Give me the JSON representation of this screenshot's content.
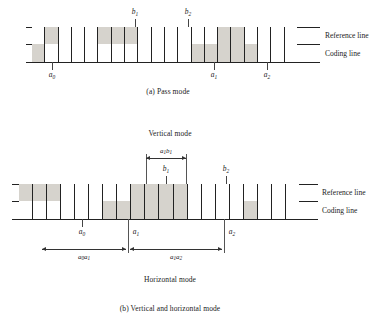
{
  "figure": {
    "title_a": "(a)  Pass mode",
    "title_b": "(b)  Vertical and horizontal mode",
    "shade_color": "#d6d3cd",
    "line_color": "#222222"
  },
  "panel_a": {
    "caption": "(a)  Pass mode",
    "row_labels": {
      "reference": "Reference line",
      "coding": "Coding line"
    },
    "reference_cells": 20,
    "coding_cells": 20,
    "reference_shaded": [
      2,
      6,
      7,
      8,
      15,
      16
    ],
    "coding_shaded": [
      1,
      13,
      14,
      15,
      16,
      17
    ],
    "markers_above": [
      {
        "label": "b",
        "sub": "1",
        "cell": 6
      },
      {
        "label": "b",
        "sub": "2",
        "cell": 10
      }
    ],
    "markers_below": [
      {
        "label": "a",
        "sub": "0",
        "cell": 1
      },
      {
        "label": "a",
        "sub": "1",
        "cell": 13
      },
      {
        "label": "a",
        "sub": "2",
        "cell": 17
      }
    ]
  },
  "panel_b": {
    "caption": "(b)  Vertical and horizontal mode",
    "mode_top": "Vertical mode",
    "mode_bottom": "Horizontal mode",
    "row_labels": {
      "reference": "Reference line",
      "coding": "Coding line"
    },
    "reference_cells": 20,
    "coding_cells": 20,
    "reference_shaded": [
      1,
      2,
      3,
      9,
      10,
      11,
      12
    ],
    "coding_shaded": [
      7,
      8,
      9,
      10,
      11,
      12,
      17
    ],
    "markers_above": [
      {
        "label": "b",
        "sub": "1",
        "cell": 9
      },
      {
        "label": "b",
        "sub": "2",
        "cell": 13
      }
    ],
    "markers_below": [
      {
        "label": "a",
        "sub": "0",
        "cell": 4
      },
      {
        "label": "a",
        "sub": "1",
        "cell": 7
      },
      {
        "label": "a",
        "sub": "2",
        "cell": 13
      }
    ],
    "dimension_top": {
      "label": "a",
      "sub": "1",
      "label2": "b",
      "sub2": "1"
    },
    "dimensions_bottom": [
      {
        "label": "a",
        "sub": "0",
        "label2": "a",
        "sub2": "1"
      },
      {
        "label": "a",
        "sub": "1",
        "label2": "a",
        "sub2": "2"
      }
    ]
  }
}
